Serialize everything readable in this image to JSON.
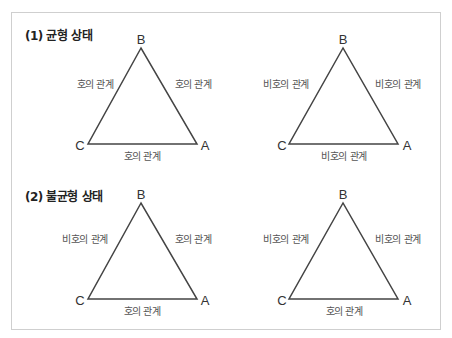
{
  "sections": [
    {
      "title": "(1) 균형 상태",
      "diagrams": [
        {
          "vertices": {
            "top": "B",
            "left": "C",
            "right": "A"
          },
          "edges": {
            "left": "호의 관계",
            "right": "호의 관계",
            "bottom": "호의 관계"
          }
        },
        {
          "vertices": {
            "top": "B",
            "left": "C",
            "right": "A"
          },
          "edges": {
            "left": "비호의 관계",
            "right": "비호의 관계",
            "bottom": "비호의 관계"
          }
        }
      ]
    },
    {
      "title": "(2) 불균형 상태",
      "diagrams": [
        {
          "vertices": {
            "top": "B",
            "left": "C",
            "right": "A"
          },
          "edges": {
            "left": "비호의 관계",
            "right": "호의 관계",
            "bottom": "호의 관계"
          }
        },
        {
          "vertices": {
            "top": "B",
            "left": "C",
            "right": "A"
          },
          "edges": {
            "left": "비호의 관계",
            "right": "비호의 관계",
            "bottom": "호의 관계"
          }
        }
      ]
    }
  ]
}
